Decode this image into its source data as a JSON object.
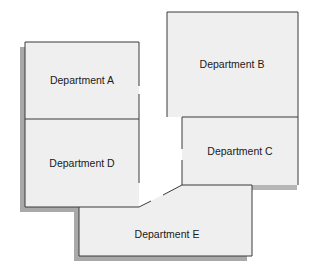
{
  "diagram": {
    "type": "floor-plan",
    "colors": {
      "fill": "#efefef",
      "stroke": "#3a3a3a",
      "shadow": "#a9a9a9",
      "background": "#ffffff"
    },
    "departments": [
      {
        "id": "A",
        "label": "Department A"
      },
      {
        "id": "B",
        "label": "Department B"
      },
      {
        "id": "C",
        "label": "Department C"
      },
      {
        "id": "D",
        "label": "Department D"
      },
      {
        "id": "E",
        "label": "Department E"
      }
    ]
  }
}
